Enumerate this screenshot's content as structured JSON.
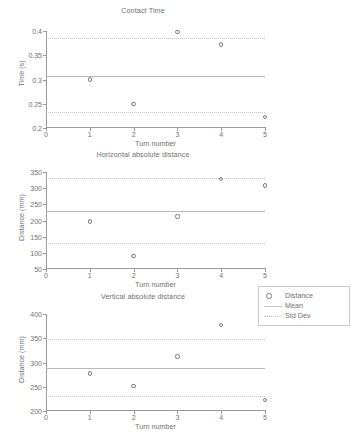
{
  "figure": {
    "background": "#ffffff",
    "axis_color": "#9a9a9a",
    "marker_color": "#7d7d7d",
    "mean_color": "#b9b9b9",
    "std_color": "#c2c2c2"
  },
  "legend": {
    "items": [
      {
        "label": "Distance",
        "key": "circle-marker"
      },
      {
        "label": "Mean",
        "key": "solid-line"
      },
      {
        "label": "Std Dev",
        "key": "dotted-line"
      }
    ]
  },
  "chart_data": [
    {
      "type": "scatter",
      "title": "Contact Time",
      "xlabel": "Turn number",
      "ylabel": "Time (s)",
      "x": [
        1,
        2,
        3,
        4,
        5
      ],
      "values": [
        0.3,
        0.249,
        0.398,
        0.372,
        0.223
      ],
      "series": [
        {
          "name": "Distance",
          "values": [
            0.3,
            0.249,
            0.398,
            0.372,
            0.223
          ]
        }
      ],
      "mean": 0.308,
      "std_dev_upper": 0.386,
      "std_dev_lower": 0.232,
      "xlim": [
        0,
        5
      ],
      "ylim": [
        0.2,
        0.4
      ],
      "xticks": [
        0,
        1,
        2,
        3,
        4,
        5
      ],
      "xticklabels": [
        "0",
        "1",
        "2",
        "3",
        "4",
        "5"
      ],
      "yticks": [
        0.2,
        0.25,
        0.3,
        0.35,
        0.4
      ],
      "yticklabels": [
        "0.2",
        "0.25",
        "0.3",
        "0.35",
        "0.4"
      ],
      "grid": false,
      "legend_position": "none"
    },
    {
      "type": "scatter",
      "title": "Horizontal absolute distance",
      "xlabel": "Turn number",
      "ylabel": "Distance (mm)",
      "x": [
        1,
        2,
        3,
        4,
        5
      ],
      "values": [
        197,
        90,
        212,
        329,
        308
      ],
      "series": [
        {
          "name": "Distance",
          "values": [
            197,
            90,
            212,
            329,
            308
          ]
        }
      ],
      "mean": 228,
      "std_dev_upper": 330,
      "std_dev_lower": 130,
      "xlim": [
        0,
        5
      ],
      "ylim": [
        50,
        350
      ],
      "xticks": [
        0,
        1,
        2,
        3,
        4,
        5
      ],
      "xticklabels": [
        "0",
        "1",
        "2",
        "3",
        "4",
        "5"
      ],
      "yticks": [
        50,
        100,
        150,
        200,
        250,
        300,
        350
      ],
      "yticklabels": [
        "50",
        "100",
        "150",
        "200",
        "250",
        "300",
        "350"
      ],
      "grid": false,
      "legend_position": "none"
    },
    {
      "type": "scatter",
      "title": "Vertical absolute distance",
      "xlabel": "Turn number",
      "ylabel": "Distance (mm)",
      "x": [
        1,
        2,
        3,
        4,
        5
      ],
      "values": [
        277,
        251,
        312,
        377,
        223
      ],
      "series": [
        {
          "name": "Distance",
          "values": [
            277,
            251,
            312,
            377,
            223
          ]
        }
      ],
      "mean": 289,
      "std_dev_upper": 348,
      "std_dev_lower": 230,
      "xlim": [
        0,
        5
      ],
      "ylim": [
        200,
        400
      ],
      "xticks": [
        0,
        1,
        2,
        3,
        4,
        5
      ],
      "xticklabels": [
        "0",
        "1",
        "2",
        "3",
        "4",
        "5"
      ],
      "yticks": [
        200,
        250,
        300,
        350,
        400
      ],
      "yticklabels": [
        "200",
        "250",
        "300",
        "350",
        "400"
      ],
      "grid": false,
      "legend_position": "right"
    }
  ]
}
